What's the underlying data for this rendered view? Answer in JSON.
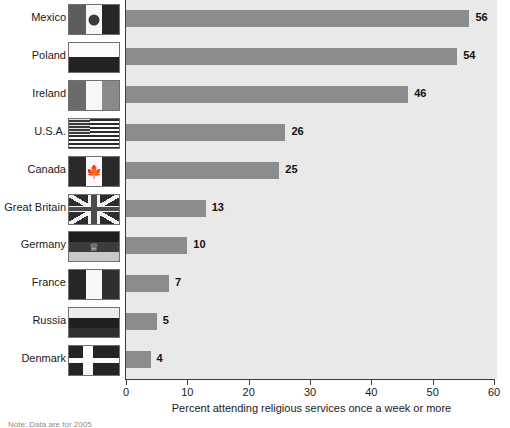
{
  "chart_data": {
    "type": "bar",
    "orientation": "horizontal",
    "title": "",
    "xlabel": "Percent attending religious services once a week or more",
    "ylabel": "",
    "xlim": [
      0,
      60
    ],
    "xticks": [
      0,
      10,
      20,
      30,
      40,
      50,
      60
    ],
    "grid": false,
    "legend": null,
    "categories": [
      "Mexico",
      "Poland",
      "Ireland",
      "U.S.A.",
      "Canada",
      "Great Britain",
      "Germany",
      "France",
      "Russia",
      "Denmark"
    ],
    "values": [
      56,
      54,
      46,
      26,
      25,
      13,
      10,
      7,
      5,
      4
    ],
    "value_labels": [
      "56",
      "54",
      "46",
      "26",
      "25",
      "13",
      "10",
      "7",
      "5",
      "4"
    ],
    "bar_color": "#8c8c8c",
    "plot_background": "#e9e9e9",
    "axis_color": "#3c3c3c"
  },
  "rows": [
    {
      "label": "Mexico",
      "value": 56,
      "value_label": "56",
      "flag": "flag-mexico"
    },
    {
      "label": "Poland",
      "value": 54,
      "value_label": "54",
      "flag": "flag-poland"
    },
    {
      "label": "Ireland",
      "value": 46,
      "value_label": "46",
      "flag": "flag-ireland"
    },
    {
      "label": "U.S.A.",
      "value": 26,
      "value_label": "26",
      "flag": "flag-usa"
    },
    {
      "label": "Canada",
      "value": 25,
      "value_label": "25",
      "flag": "flag-canada"
    },
    {
      "label": "Great Britain",
      "value": 13,
      "value_label": "13",
      "flag": "flag-great-britain"
    },
    {
      "label": "Germany",
      "value": 10,
      "value_label": "10",
      "flag": "flag-germany"
    },
    {
      "label": "France",
      "value": 7,
      "value_label": "7",
      "flag": "flag-france"
    },
    {
      "label": "Russia",
      "value": 5,
      "value_label": "5",
      "flag": "flag-russia"
    },
    {
      "label": "Denmark",
      "value": 4,
      "value_label": "4",
      "flag": "flag-denmark"
    }
  ],
  "axis": {
    "tick_labels": [
      "0",
      "10",
      "20",
      "30",
      "40",
      "50",
      "60"
    ],
    "title": "Percent attending religious services once a week or more"
  },
  "footnote": "Note: Data are for 2005",
  "colors": {
    "bar": "#8c8c8c",
    "plot_bg": "#e9e9e9",
    "axis": "#3c3c3c",
    "text": "#1a1a1a"
  }
}
